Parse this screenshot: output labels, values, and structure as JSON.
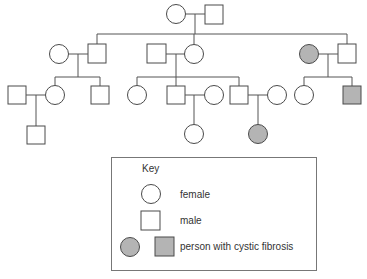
{
  "colors": {
    "unaffected_fill": "#ffffff",
    "affected_fill": "#b4b4b4",
    "line": "#555555",
    "text": "#333333"
  },
  "pedigree": {
    "generations": [
      {
        "number": 1,
        "individuals": [
          {
            "id": "g1-f",
            "sex": "female",
            "affected": false
          },
          {
            "id": "g1-m",
            "sex": "male",
            "affected": false
          }
        ]
      },
      {
        "number": 2,
        "individuals": [
          {
            "id": "g2-f1-spouse",
            "sex": "female",
            "affected": false
          },
          {
            "id": "g2-m1",
            "sex": "male",
            "affected": false
          },
          {
            "id": "g2-m2-spouse",
            "sex": "male",
            "affected": false
          },
          {
            "id": "g2-f2",
            "sex": "female",
            "affected": false
          },
          {
            "id": "g2-f3",
            "sex": "female",
            "affected": true
          },
          {
            "id": "g2-m3-spouse",
            "sex": "male",
            "affected": false
          }
        ]
      },
      {
        "number": 3,
        "individuals": [
          {
            "id": "g3-m1-spouse",
            "sex": "male",
            "affected": false
          },
          {
            "id": "g3-f1",
            "sex": "female",
            "affected": false
          },
          {
            "id": "g3-m2",
            "sex": "male",
            "affected": false
          },
          {
            "id": "g3-f2",
            "sex": "female",
            "affected": false
          },
          {
            "id": "g3-m3",
            "sex": "male",
            "affected": false
          },
          {
            "id": "g3-f3-spouse",
            "sex": "female",
            "affected": false
          },
          {
            "id": "g3-m4",
            "sex": "male",
            "affected": false
          },
          {
            "id": "g3-f4-spouse",
            "sex": "female",
            "affected": false
          },
          {
            "id": "g3-f5",
            "sex": "female",
            "affected": false
          },
          {
            "id": "g3-m5",
            "sex": "male",
            "affected": true
          }
        ]
      },
      {
        "number": 4,
        "individuals": [
          {
            "id": "g4-m1",
            "sex": "male",
            "affected": false
          },
          {
            "id": "g4-f1",
            "sex": "female",
            "affected": false
          },
          {
            "id": "g4-f2",
            "sex": "female",
            "affected": true
          }
        ]
      }
    ]
  },
  "key": {
    "title": "Key",
    "entries": [
      {
        "symbol": "circle",
        "label": "female"
      },
      {
        "symbol": "square",
        "label": "male"
      },
      {
        "symbol": "filled-circle-and-square",
        "label": "person with cystic fibrosis"
      }
    ]
  }
}
